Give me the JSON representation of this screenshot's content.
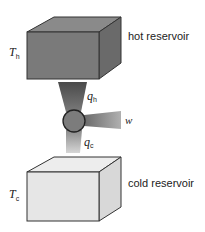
{
  "hot_reservoir": {
    "label": "hot reservoir",
    "temperature_symbol": "T",
    "temperature_subscript": "h",
    "colors": {
      "front": "#7a7a7a",
      "top": "#8a8a8a",
      "side": "#6a6a6a"
    }
  },
  "cold_reservoir": {
    "label": "cold reservoir",
    "temperature_symbol": "T",
    "temperature_subscript": "c",
    "colors": {
      "front": "#e6e6e6",
      "top": "#ededed",
      "side": "#d8d8d8"
    }
  },
  "engine": {
    "heat_in": {
      "symbol": "q",
      "subscript": "h"
    },
    "heat_out": {
      "symbol": "q",
      "subscript": "c"
    },
    "work": {
      "symbol": "w"
    }
  }
}
